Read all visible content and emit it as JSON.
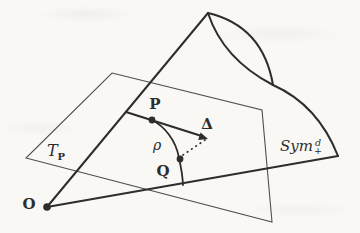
{
  "figure": {
    "colors": {
      "ink": "#2d2d2d",
      "plane_line": "#4f4f4f",
      "background": "#f9f8f5"
    },
    "labels": {
      "point_p": "P",
      "tangent_vector": "Δ",
      "geodesic": "ρ",
      "point_q": "Q",
      "origin": "O",
      "tangent_space_symbol": "T",
      "tangent_space_subscript": "P",
      "manifold_name": "Sym",
      "manifold_superscript": "d",
      "manifold_subscript": "+"
    }
  }
}
